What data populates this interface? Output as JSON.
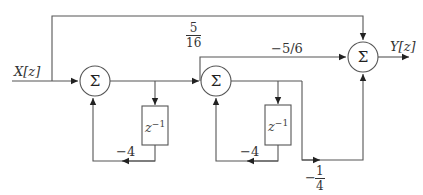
{
  "diagram": {
    "type": "signal-flow block diagram",
    "input_label": "X[z]",
    "output_label": "Y[z]",
    "summing_junctions": [
      {
        "id": "sum1",
        "symbol": "Σ"
      },
      {
        "id": "sum2",
        "symbol": "Σ"
      },
      {
        "id": "sum3",
        "symbol": "Σ"
      }
    ],
    "delays": [
      {
        "id": "delay1",
        "label": "z",
        "exponent": "−1"
      },
      {
        "id": "delay2",
        "label": "z",
        "exponent": "−1"
      }
    ],
    "gains": {
      "feedforward_top": {
        "num": "5",
        "den": "16"
      },
      "middle_path": "−5/6",
      "feedback1": "−4",
      "feedback2": "−4",
      "bottom_path": {
        "sign": "−",
        "num": "1",
        "den": "4"
      }
    }
  }
}
